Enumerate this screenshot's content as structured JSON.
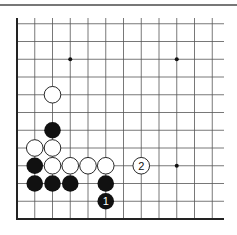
{
  "diagram": {
    "type": "go-board-corner",
    "grid": {
      "origin_x": 17,
      "bottom_y": 219,
      "spacing": 17.75,
      "columns": 12,
      "rows": 12,
      "right_end": 224,
      "top_end": 18
    },
    "star_points": [
      [
        3,
        9
      ],
      [
        9,
        9
      ],
      [
        9,
        3
      ]
    ],
    "stones": [
      {
        "color": "white",
        "col": 2,
        "row": 7
      },
      {
        "color": "black",
        "col": 2,
        "row": 5
      },
      {
        "color": "white",
        "col": 1,
        "row": 4
      },
      {
        "color": "white",
        "col": 2,
        "row": 4
      },
      {
        "color": "black",
        "col": 1,
        "row": 3
      },
      {
        "color": "white",
        "col": 2,
        "row": 3
      },
      {
        "color": "white",
        "col": 3,
        "row": 3
      },
      {
        "color": "white",
        "col": 4,
        "row": 3
      },
      {
        "color": "white",
        "col": 5,
        "row": 3
      },
      {
        "color": "black",
        "col": 1,
        "row": 2
      },
      {
        "color": "black",
        "col": 2,
        "row": 2
      },
      {
        "color": "black",
        "col": 3,
        "row": 2
      },
      {
        "color": "black",
        "col": 5,
        "row": 2
      },
      {
        "color": "black",
        "col": 5,
        "row": 1,
        "label": "1"
      },
      {
        "color": "white",
        "col": 7,
        "row": 3,
        "label": "2"
      }
    ],
    "colors": {
      "black": "#111111",
      "white": "#ffffff",
      "line": "#555555",
      "edge": "#222222"
    }
  }
}
